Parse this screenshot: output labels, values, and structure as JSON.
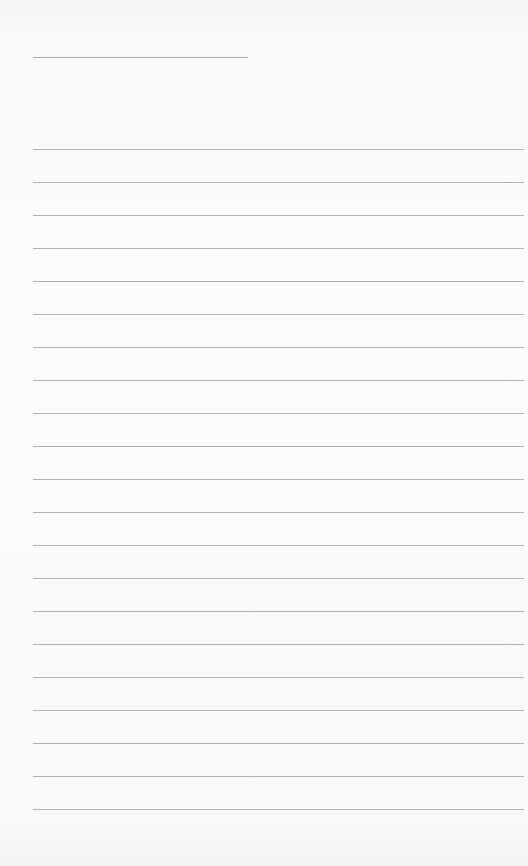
{
  "page": {
    "type": "lined-notepaper",
    "background_color": "#f7f7f7",
    "line_color": "#b3b3b3"
  },
  "header": {
    "field_text": ""
  },
  "lines": [
    {
      "text": ""
    },
    {
      "text": ""
    },
    {
      "text": ""
    },
    {
      "text": ""
    },
    {
      "text": ""
    },
    {
      "text": ""
    },
    {
      "text": ""
    },
    {
      "text": ""
    },
    {
      "text": ""
    },
    {
      "text": ""
    },
    {
      "text": ""
    },
    {
      "text": ""
    },
    {
      "text": ""
    },
    {
      "text": ""
    },
    {
      "text": ""
    },
    {
      "text": ""
    },
    {
      "text": ""
    },
    {
      "text": ""
    },
    {
      "text": ""
    },
    {
      "text": ""
    },
    {
      "text": ""
    }
  ]
}
